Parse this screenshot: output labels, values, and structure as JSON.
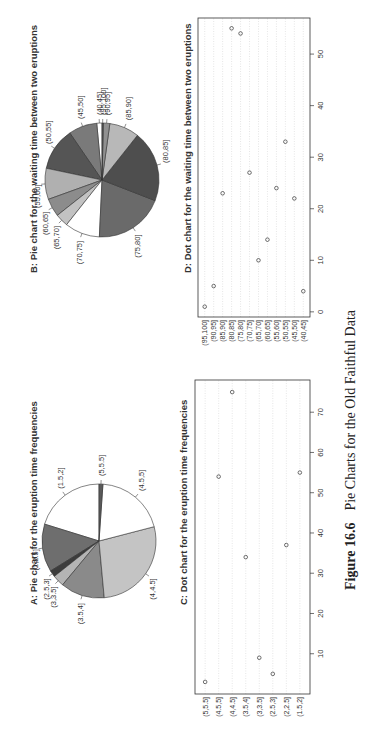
{
  "figure": {
    "caption_label": "Figure 16.6",
    "caption_text": "Pie Charts for the Old Faithful Data"
  },
  "panels": {
    "A": {
      "title": "A: Pie chart for the eruption time frequencies"
    },
    "B": {
      "title": "B: Pie chart for the waiting time between two eruptions"
    },
    "C": {
      "title": "C: Dot chart for the eruption time frequencies"
    },
    "D": {
      "title": "D: Dot chart for the waiting time between two eruptions"
    }
  },
  "chart_data": [
    {
      "id": "A",
      "type": "pie",
      "title": "A: Pie chart for the eruption time frequencies",
      "categories": [
        "(1.5,2]",
        "(2,2.5]",
        "(2.5,3]",
        "(3,3.5]",
        "(3.5,4]",
        "(4,4.5]",
        "(4.5,5]",
        "(5,5.5]"
      ],
      "values": [
        55,
        37,
        5,
        9,
        34,
        75,
        54,
        3
      ],
      "colors": [
        "#ffffff",
        "#6e6e6e",
        "#3c3c3c",
        "#b4b4b4",
        "#8a8a8a",
        "#c4c4c4",
        "#ffffff",
        "#5a5a5a"
      ]
    },
    {
      "id": "B",
      "type": "pie",
      "title": "B: Pie chart for the waiting time between two eruptions",
      "categories": [
        "(40,45]",
        "(45,50]",
        "(50,55]",
        "(55,60]",
        "(60,65]",
        "(65,70]",
        "(70,75]",
        "(75,80]",
        "(80,85]",
        "(85,90]",
        "(90,95]",
        "(95,100]"
      ],
      "values": [
        4,
        22,
        33,
        24,
        14,
        10,
        27,
        54,
        55,
        23,
        5,
        1
      ],
      "colors": [
        "#ffffff",
        "#7a7a7a",
        "#555555",
        "#b0b0b0",
        "#8c8c8c",
        "#c2c2c2",
        "#ffffff",
        "#6a6a6a",
        "#4e4e4e",
        "#b8b8b8",
        "#909090",
        "#5a5a5a"
      ]
    },
    {
      "id": "C",
      "type": "scatter",
      "subtype": "dotchart",
      "title": "C: Dot chart for the eruption time frequencies",
      "categories": [
        "(1.5,2]",
        "(2,2.5]",
        "(2.5,3]",
        "(3,3.5]",
        "(3.5,4]",
        "(4,4.5]",
        "(4.5,5]",
        "(5,5.5]"
      ],
      "values": [
        55,
        37,
        5,
        9,
        34,
        75,
        54,
        3
      ],
      "xlabel": "",
      "ylabel": "",
      "xlim": [
        0,
        78
      ],
      "xticks": [
        10,
        20,
        30,
        40,
        50,
        60,
        70
      ],
      "grid": true
    },
    {
      "id": "D",
      "type": "scatter",
      "subtype": "dotchart",
      "title": "D: Dot chart for the waiting time between two eruptions",
      "categories": [
        "(40,45]",
        "(45,50]",
        "(50,55]",
        "(55,60]",
        "(60,65]",
        "(65,70]",
        "(70,75]",
        "(75,80]",
        "(80,85]",
        "(85,90]",
        "(90,95]",
        "(95,100]"
      ],
      "values": [
        4,
        22,
        33,
        24,
        14,
        10,
        27,
        54,
        55,
        23,
        5,
        1
      ],
      "xlabel": "",
      "ylabel": "",
      "xlim": [
        -1,
        57
      ],
      "xticks": [
        0,
        10,
        20,
        30,
        40,
        50
      ],
      "grid": true
    }
  ]
}
